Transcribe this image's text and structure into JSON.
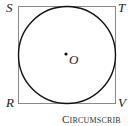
{
  "diagram": {
    "type": "circle inscribed in square",
    "square": {
      "vertices": [
        "S",
        "T",
        "V",
        "R"
      ],
      "stroke": "#888888"
    },
    "circle": {
      "center_label": "O",
      "stroke": "#111111"
    },
    "labels": {
      "top_left": "S",
      "top_right": "T",
      "bottom_left": "R",
      "bottom_right": "V",
      "center": "O"
    },
    "caption": "Circumscrib"
  }
}
